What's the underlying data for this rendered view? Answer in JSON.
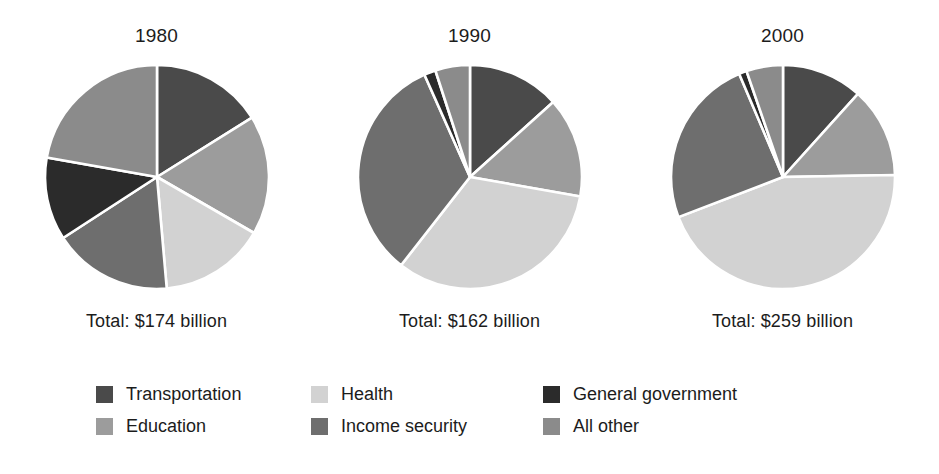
{
  "legend": {
    "rows": [
      [
        {
          "label": "Transportation",
          "key": "transportation",
          "color": "#4a4a4a"
        },
        {
          "label": "Health",
          "key": "health",
          "color": "#d2d2d2"
        },
        {
          "label": "General government",
          "key": "general_government",
          "color": "#2b2b2b"
        }
      ],
      [
        {
          "label": "Education",
          "key": "education",
          "color": "#9c9c9c"
        },
        {
          "label": "Income security",
          "key": "income_security",
          "color": "#6e6e6e"
        },
        {
          "label": "All other",
          "key": "all_other",
          "color": "#8b8b8b"
        }
      ]
    ]
  },
  "chart_data": [
    {
      "type": "pie",
      "title": "1980",
      "total_label": "Total: $174 billion",
      "total_value": 174,
      "total_units": "billion dollars",
      "start_angle": 0,
      "direction": "clockwise",
      "categories": [
        "Transportation",
        "Education",
        "Health",
        "Income security",
        "General government",
        "All other"
      ],
      "values": [
        58,
        62,
        55,
        62,
        43,
        80
      ],
      "slices": [
        {
          "label": "Transportation",
          "angle": 58,
          "color": "#4a4a4a"
        },
        {
          "label": "Education",
          "angle": 62,
          "color": "#9c9c9c"
        },
        {
          "label": "Health",
          "angle": 55,
          "color": "#d2d2d2"
        },
        {
          "label": "Income security",
          "angle": 62,
          "color": "#6e6e6e"
        },
        {
          "label": "General government",
          "angle": 43,
          "color": "#2b2b2b"
        },
        {
          "label": "All other",
          "angle": 80,
          "color": "#8b8b8b"
        }
      ]
    },
    {
      "type": "pie",
      "title": "1990",
      "total_label": "Total: $162 billion",
      "total_value": 162,
      "total_units": "billion dollars",
      "start_angle": 0,
      "direction": "clockwise",
      "categories": [
        "Transportation",
        "Education",
        "Health",
        "Income security",
        "General government",
        "All other"
      ],
      "values": [
        48,
        52,
        118,
        118,
        6,
        18
      ],
      "slices": [
        {
          "label": "Transportation",
          "angle": 48,
          "color": "#4a4a4a"
        },
        {
          "label": "Education",
          "angle": 52,
          "color": "#9c9c9c"
        },
        {
          "label": "Health",
          "angle": 118,
          "color": "#d2d2d2"
        },
        {
          "label": "Income security",
          "angle": 118,
          "color": "#6e6e6e"
        },
        {
          "label": "General government",
          "angle": 6,
          "color": "#2b2b2b"
        },
        {
          "label": "All other",
          "angle": 18,
          "color": "#8b8b8b"
        }
      ]
    },
    {
      "type": "pie",
      "title": "2000",
      "total_label": "Total: $259 billion",
      "total_value": 259,
      "total_units": "billion dollars",
      "start_angle": 0,
      "direction": "clockwise",
      "categories": [
        "Transportation",
        "Education",
        "Health",
        "Income security",
        "General government",
        "All other"
      ],
      "values": [
        42,
        47,
        160,
        88,
        4,
        19
      ],
      "slices": [
        {
          "label": "Transportation",
          "angle": 42,
          "color": "#4a4a4a"
        },
        {
          "label": "Education",
          "angle": 47,
          "color": "#9c9c9c"
        },
        {
          "label": "Health",
          "angle": 160,
          "color": "#d2d2d2"
        },
        {
          "label": "Income security",
          "angle": 88,
          "color": "#6e6e6e"
        },
        {
          "label": "General government",
          "angle": 4,
          "color": "#2b2b2b"
        },
        {
          "label": "All other",
          "angle": 19,
          "color": "#8b8b8b"
        }
      ]
    }
  ]
}
